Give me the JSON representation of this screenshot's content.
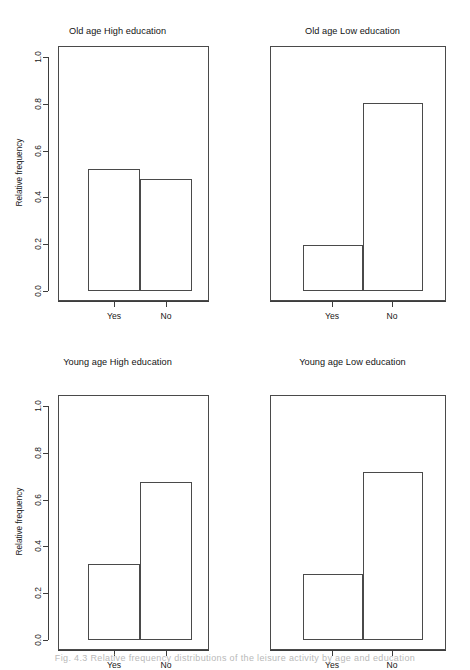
{
  "figure": {
    "background_color": "#ffffff",
    "line_color": "#4a4a4a",
    "text_color": "#171717",
    "caption": "Fig. 4.3 Relative frequency distributions of the leisure activity by age and education"
  },
  "axes": {
    "ylabel": "Relative frequency",
    "ytick_labels": [
      "0.0",
      "0.2",
      "0.4",
      "0.6",
      "0.8",
      "1.0"
    ],
    "ytick_values": [
      0.0,
      0.2,
      0.4,
      0.6,
      0.8,
      1.0
    ],
    "ylim": [
      0.0,
      1.04
    ],
    "xtick_labels": [
      "Yes",
      "No"
    ]
  },
  "panels": [
    {
      "id": "old-age-high-education",
      "title": "Old age High education",
      "show_yaxis": true,
      "categories": [
        "Yes",
        "No"
      ],
      "values": [
        0.52,
        0.48
      ]
    },
    {
      "id": "old-age-low-education",
      "title": "Old age Low education",
      "show_yaxis": false,
      "categories": [
        "Yes",
        "No"
      ],
      "values": [
        0.195,
        0.805
      ]
    },
    {
      "id": "young-age-high-education",
      "title": "Young age High education",
      "show_yaxis": true,
      "categories": [
        "Yes",
        "No"
      ],
      "values": [
        0.325,
        0.675
      ]
    },
    {
      "id": "young-age-low-education",
      "title": "Young age Low education",
      "show_yaxis": false,
      "categories": [
        "Yes",
        "No"
      ],
      "values": [
        0.28,
        0.72
      ]
    }
  ],
  "chart_data": {
    "type": "bar",
    "xlabel": "",
    "ylabel": "Relative frequency",
    "ylim": [
      0.0,
      1.04
    ],
    "grid": false,
    "legend": "none",
    "categories": [
      "Yes",
      "No"
    ],
    "panel_layout": "2x2",
    "panels": [
      {
        "title": "Old age High education",
        "categories": [
          "Yes",
          "No"
        ],
        "values": [
          0.52,
          0.48
        ]
      },
      {
        "title": "Old age Low education",
        "categories": [
          "Yes",
          "No"
        ],
        "values": [
          0.195,
          0.805
        ]
      },
      {
        "title": "Young age High education",
        "categories": [
          "Yes",
          "No"
        ],
        "values": [
          0.325,
          0.675
        ]
      },
      {
        "title": "Young age Low education",
        "categories": [
          "Yes",
          "No"
        ],
        "values": [
          0.28,
          0.72
        ]
      }
    ]
  }
}
